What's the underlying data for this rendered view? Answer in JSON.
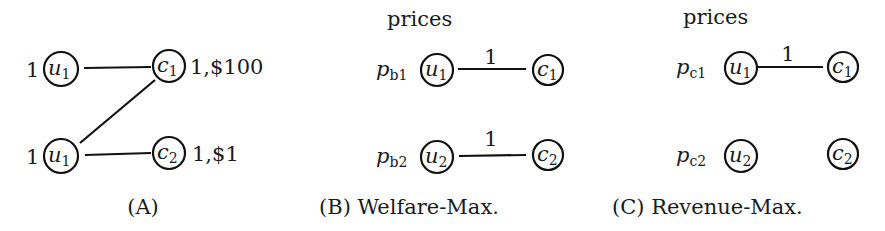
{
  "panels": {
    "A": {
      "caption": "(A)",
      "nodes": {
        "u_top": {
          "base": "u",
          "sub": "1",
          "weight": "1"
        },
        "u_bottom": {
          "base": "u",
          "sub": "1",
          "weight": "1"
        },
        "c1": {
          "base": "c",
          "sub": "1",
          "annotation": "1,$100"
        },
        "c2": {
          "base": "c",
          "sub": "2",
          "annotation": "1,$1"
        }
      },
      "edges": [
        {
          "from": "u_top",
          "to": "c1"
        },
        {
          "from": "u_bottom",
          "to": "c1"
        },
        {
          "from": "u_bottom",
          "to": "c2"
        }
      ]
    },
    "B": {
      "header": "prices",
      "caption": "(B) Welfare-Max.",
      "nodes": {
        "u1": {
          "base": "u",
          "sub": "1",
          "price_base": "p",
          "price_sub": "b1"
        },
        "u2": {
          "base": "u",
          "sub": "2",
          "price_base": "p",
          "price_sub": "b2"
        },
        "c1": {
          "base": "c",
          "sub": "1"
        },
        "c2": {
          "base": "c",
          "sub": "2"
        }
      },
      "edges": [
        {
          "from": "u1",
          "to": "c1",
          "label": "1"
        },
        {
          "from": "u2",
          "to": "c2",
          "label": "1"
        }
      ]
    },
    "C": {
      "header": "prices",
      "caption": "(C) Revenue-Max.",
      "nodes": {
        "u1": {
          "base": "u",
          "sub": "1",
          "price_base": "p",
          "price_sub": "c1"
        },
        "u2": {
          "base": "u",
          "sub": "2",
          "price_base": "p",
          "price_sub": "c2"
        },
        "c1": {
          "base": "c",
          "sub": "1"
        },
        "c2": {
          "base": "c",
          "sub": "2"
        }
      },
      "edges": [
        {
          "from": "u1",
          "to": "c1",
          "label": "1"
        }
      ]
    }
  }
}
